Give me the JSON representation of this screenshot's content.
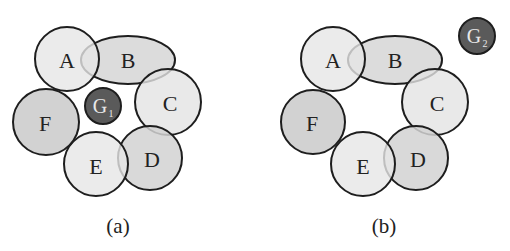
{
  "colors": {
    "light_fill": "#e4e4e4",
    "mid_fill": "#d2d2d2",
    "dark_fill": "#5a5a5a",
    "stroke": "#1e1e1e"
  },
  "panels": [
    {
      "caption": "(a)",
      "nodes": {
        "A": "A",
        "B": "B",
        "C": "C",
        "D": "D",
        "E": "E",
        "F": "F"
      },
      "g_node": {
        "letter": "G",
        "subscript": "1"
      }
    },
    {
      "caption": "(b)",
      "nodes": {
        "A": "A",
        "B": "B",
        "C": "C",
        "D": "D",
        "E": "E",
        "F": "F"
      },
      "g_node": {
        "letter": "G",
        "subscript": "2"
      }
    }
  ]
}
